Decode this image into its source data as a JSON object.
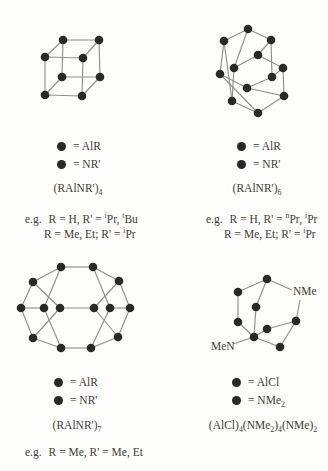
{
  "colors": {
    "background": "#fdfdfc",
    "text": "#433c36",
    "bond_line": "#8f8f8f",
    "atom_dot": "#2b2926"
  },
  "panels": [
    {
      "name": "cube-tetramer",
      "legend": [
        {
          "symbol": "atom-dot",
          "label": "= AlR"
        },
        {
          "symbol": "atom-dot",
          "label": "= NR'"
        }
      ],
      "formula": "(RAlNR')_4",
      "examples": [
        {
          "prefix": "e.g.",
          "text": "R = H, R' = ^iPr, ^tBu"
        },
        {
          "prefix": "",
          "text": "R = Me, Et; R' = ^iPr"
        }
      ]
    },
    {
      "name": "hexagonal-prism-hexamer",
      "legend": [
        {
          "symbol": "atom-dot",
          "label": "= AlR"
        },
        {
          "symbol": "atom-dot",
          "label": "= NR'"
        }
      ],
      "formula": "(RAlNR')_6",
      "examples": [
        {
          "prefix": "e.g.",
          "text": "R = H, R' = ^nPr, ^iPr"
        },
        {
          "prefix": "",
          "text": "R = Me, Et; R' = ^iPr"
        }
      ]
    },
    {
      "name": "heptamer-cage",
      "legend": [
        {
          "symbol": "atom-dot",
          "label": "= AlR"
        },
        {
          "symbol": "atom-dot",
          "label": "= NR'"
        }
      ],
      "formula": "(RAlNR')_7",
      "examples": [
        {
          "prefix": "e.g.",
          "text": "R = Me, R' = Me, Et"
        }
      ]
    },
    {
      "name": "adamantane-cage",
      "legend": [
        {
          "symbol": "atom-dot",
          "label": "= AlCl"
        },
        {
          "symbol": "atom-dot",
          "label": "= NMe_2"
        }
      ],
      "formula": "(AlCl)_4(NMe_2)_4(NMe)_2",
      "examples": [],
      "atom_labels": [
        {
          "text": "NMe"
        },
        {
          "text": "MeN"
        }
      ]
    }
  ],
  "structures": {
    "cube": {
      "nodes": [
        [
          45,
          57
        ],
        [
          83,
          58
        ],
        [
          82,
          96
        ],
        [
          45,
          95
        ],
        [
          63,
          40
        ],
        [
          99,
          40
        ],
        [
          100,
          77
        ],
        [
          62,
          77
        ]
      ],
      "edges": [
        [
          0,
          1
        ],
        [
          1,
          2
        ],
        [
          2,
          3
        ],
        [
          3,
          0
        ],
        [
          4,
          5
        ],
        [
          5,
          6
        ],
        [
          6,
          7
        ],
        [
          7,
          4
        ],
        [
          0,
          4
        ],
        [
          1,
          5
        ],
        [
          2,
          6
        ],
        [
          3,
          7
        ]
      ]
    },
    "hexagonal_prism": {
      "nodes": [
        [
          248,
          29
        ],
        [
          271,
          40
        ],
        [
          272,
          77
        ],
        [
          247,
          88
        ],
        [
          220,
          74
        ],
        [
          224,
          41
        ],
        [
          258,
          55
        ],
        [
          283,
          68
        ],
        [
          284,
          96
        ],
        [
          258,
          113
        ],
        [
          232,
          101
        ],
        [
          234,
          68
        ]
      ],
      "edges": [
        [
          0,
          1
        ],
        [
          1,
          2
        ],
        [
          2,
          3
        ],
        [
          3,
          4
        ],
        [
          4,
          5
        ],
        [
          5,
          0
        ],
        [
          6,
          7
        ],
        [
          7,
          8
        ],
        [
          8,
          9
        ],
        [
          9,
          10
        ],
        [
          10,
          11
        ],
        [
          11,
          6
        ],
        [
          0,
          11
        ],
        [
          1,
          6
        ],
        [
          2,
          7
        ],
        [
          3,
          8
        ],
        [
          4,
          9
        ],
        [
          5,
          10
        ]
      ]
    },
    "heptamer": {
      "nodes": [
        [
          61,
          267
        ],
        [
          93,
          267
        ],
        [
          33,
          282
        ],
        [
          119,
          281
        ],
        [
          21,
          308
        ],
        [
          44,
          308
        ],
        [
          60,
          308
        ],
        [
          94,
          308
        ],
        [
          110,
          308
        ],
        [
          130,
          308
        ],
        [
          33,
          338
        ],
        [
          118,
          337
        ],
        [
          61,
          348
        ],
        [
          91,
          348
        ]
      ],
      "edges": [
        [
          0,
          1
        ],
        [
          0,
          2
        ],
        [
          1,
          3
        ],
        [
          2,
          4
        ],
        [
          3,
          9
        ],
        [
          4,
          10
        ],
        [
          9,
          11
        ],
        [
          10,
          12
        ],
        [
          11,
          13
        ],
        [
          12,
          13
        ],
        [
          0,
          5
        ],
        [
          2,
          6
        ],
        [
          1,
          8
        ],
        [
          3,
          7
        ],
        [
          12,
          5
        ],
        [
          10,
          6
        ],
        [
          13,
          8
        ],
        [
          11,
          7
        ],
        [
          6,
          7
        ],
        [
          4,
          5
        ],
        [
          8,
          9
        ]
      ]
    },
    "adamantane": {
      "nodes": [
        [
          267,
          279
        ],
        [
          238,
          292
        ],
        [
          256,
          307
        ],
        [
          238,
          322
        ],
        [
          267,
          329
        ],
        [
          296,
          321
        ],
        [
          254,
          337
        ],
        [
          280,
          347
        ]
      ],
      "edges": [
        [
          0,
          1
        ],
        [
          0,
          2
        ],
        [
          1,
          3
        ],
        [
          2,
          6
        ],
        [
          3,
          6
        ],
        [
          4,
          5
        ],
        [
          4,
          6
        ],
        [
          5,
          7
        ],
        [
          6,
          7
        ]
      ],
      "label_lines": [
        [
          267,
          279,
          292,
          290
        ],
        [
          300,
          300,
          296,
          321
        ],
        [
          254,
          337,
          233,
          344
        ]
      ]
    }
  }
}
